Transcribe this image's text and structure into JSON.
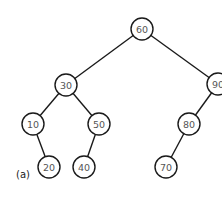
{
  "diagram": {
    "type": "binary-search-tree",
    "caption": "(a)",
    "caption_pos": {
      "x": 16,
      "y": 174
    },
    "node_radius": 11,
    "nodes": [
      {
        "id": "n60",
        "label": "60",
        "x": 142,
        "y": 29
      },
      {
        "id": "n30",
        "label": "30",
        "x": 66,
        "y": 85
      },
      {
        "id": "n90",
        "label": "90",
        "x": 218,
        "y": 84
      },
      {
        "id": "n10",
        "label": "10",
        "x": 33,
        "y": 124
      },
      {
        "id": "n50",
        "label": "50",
        "x": 99,
        "y": 124
      },
      {
        "id": "n80",
        "label": "80",
        "x": 189,
        "y": 124
      },
      {
        "id": "n20",
        "label": "20",
        "x": 49,
        "y": 167
      },
      {
        "id": "n40",
        "label": "40",
        "x": 84,
        "y": 167
      },
      {
        "id": "n70",
        "label": "70",
        "x": 166,
        "y": 167
      }
    ],
    "edges": [
      {
        "from": "n60",
        "to": "n30"
      },
      {
        "from": "n60",
        "to": "n90"
      },
      {
        "from": "n30",
        "to": "n10"
      },
      {
        "from": "n30",
        "to": "n50"
      },
      {
        "from": "n10",
        "to": "n20"
      },
      {
        "from": "n50",
        "to": "n40"
      },
      {
        "from": "n90",
        "to": "n80"
      },
      {
        "from": "n80",
        "to": "n70"
      }
    ]
  }
}
